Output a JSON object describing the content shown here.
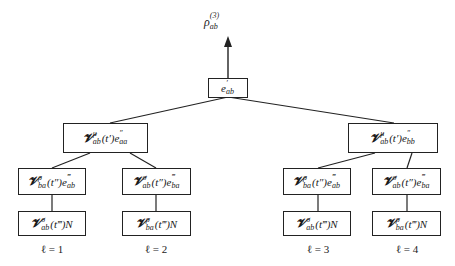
{
  "root": {
    "label": {
      "base": "ρ",
      "sub": "ab",
      "sup": "(3)"
    },
    "box": {
      "base": "e",
      "sub": "ab",
      "sup": "′"
    }
  },
  "level2": [
    {
      "v_sup": "μ",
      "v_sub": "ab",
      "arg": "(t′)",
      "e_sup": "″",
      "e_sub": "aa"
    },
    {
      "v_sup": "μ",
      "v_sub": "ab",
      "arg": "(t′)",
      "e_sup": "″",
      "e_sub": "bb"
    }
  ],
  "level3": [
    {
      "v_sup": "ρ",
      "v_sub": "ba",
      "arg": "(t″)",
      "e_sup": "‴",
      "e_sub": "ab"
    },
    {
      "v_sup": "σ",
      "v_sub": "ab",
      "arg": "(t″)",
      "e_sup": "‴",
      "e_sub": "ba"
    },
    {
      "v_sup": "ρ",
      "v_sub": "ba",
      "arg": "(t″)",
      "e_sup": "‴",
      "e_sub": "ab"
    },
    {
      "v_sup": "σ",
      "v_sub": "ab",
      "arg": "(t″)",
      "e_sup": "‴",
      "e_sub": "ba"
    }
  ],
  "level4": [
    {
      "v_sup": "σ",
      "v_sub": "ab",
      "arg": "(t‴)",
      "tail": "N"
    },
    {
      "v_sup": "ρ",
      "v_sub": "ba",
      "arg": "(t‴)",
      "tail": "N"
    },
    {
      "v_sup": "σ",
      "v_sub": "ab",
      "arg": "(t‴)",
      "tail": "N"
    },
    {
      "v_sup": "ρ",
      "v_sub": "ba",
      "arg": "(t‴)",
      "tail": "N"
    }
  ],
  "pathway_labels": [
    "ℓ = 1",
    "ℓ = 2",
    "ℓ = 3",
    "ℓ = 4"
  ],
  "symbols": {
    "V": "𝓥"
  }
}
